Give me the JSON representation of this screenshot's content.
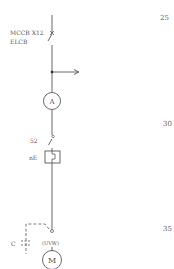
{
  "diagram": {
    "type": "single-line electrical diagram",
    "line_color": "#333333",
    "text_color": "#555555",
    "components": {
      "breaker": {
        "label_line1": "MCCB X12",
        "label_line2": "ELCB"
      },
      "branch": {
        "direction": "right"
      },
      "ammeter": {
        "symbol": "A"
      },
      "contactor": {
        "label": "52"
      },
      "overload_relay": {
        "label": "nE"
      },
      "capacitor": {
        "label": "C"
      },
      "terminal": {
        "label": "(UVW)"
      },
      "motor": {
        "symbol": "M"
      }
    },
    "line_numbers": [
      "25",
      "30",
      "35"
    ]
  }
}
